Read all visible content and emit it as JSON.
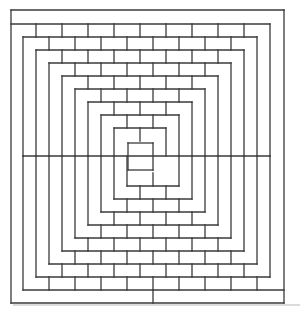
{
  "figure": {
    "stroke_color": "#3a3a3a",
    "background": "#ffffff",
    "frame": {
      "x1": 11,
      "y1": 10,
      "x2": 284,
      "y2": 303
    },
    "top_band_y": 24,
    "bottom_band_y": 290,
    "mid_y": 156,
    "ring_step": 13,
    "ring_count": 9,
    "brick_width": 26,
    "center_box": {
      "x1": 128,
      "y1": 143,
      "x2": 153,
      "y2": 170
    }
  }
}
